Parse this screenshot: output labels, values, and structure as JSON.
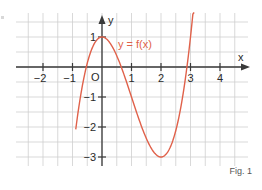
{
  "chart_data": {
    "type": "line",
    "title": "",
    "function_label": "y = f(x)",
    "xlabel": "x",
    "ylabel": "y",
    "origin_label": "O",
    "x_ticks": [
      -2,
      -1,
      1,
      2,
      3,
      4
    ],
    "x_tick_labels": [
      "−2",
      "−1",
      "1",
      "2",
      "3",
      "4"
    ],
    "y_ticks": [
      1,
      -1,
      -2,
      -3
    ],
    "y_tick_labels": [
      "1",
      "−1",
      "−2",
      "−3"
    ],
    "xlim": [
      -2.9,
      4.9
    ],
    "ylim": [
      -3.3,
      1.8
    ],
    "grid": true,
    "grid_step": 0.5,
    "series": [
      {
        "name": "f(x)",
        "color": "#e0614a",
        "x": [
          -0.97,
          -0.75,
          -0.5,
          -0.25,
          0,
          0.25,
          0.5,
          0.75,
          1,
          1.25,
          1.5,
          1.75,
          2,
          2.25,
          2.5,
          2.75,
          3,
          3.13
        ],
        "y": [
          -3.74,
          -1.11,
          0.13,
          0.8,
          1.0,
          0.83,
          0.38,
          -0.27,
          -1.0,
          -1.73,
          -2.38,
          -2.83,
          -3.0,
          -2.8,
          -2.13,
          -0.89,
          1.0,
          2.28
        ]
      }
    ],
    "key_points": {
      "local_max": [
        0,
        1
      ],
      "local_min": [
        2,
        -3
      ],
      "roots_approx": [
        -0.53,
        0.65,
        2.88
      ]
    }
  },
  "caption": "Fig. 1",
  "colors": {
    "curve": "#e0614a",
    "axis": "#3a3a3a",
    "grid": "#cfcfcf"
  }
}
